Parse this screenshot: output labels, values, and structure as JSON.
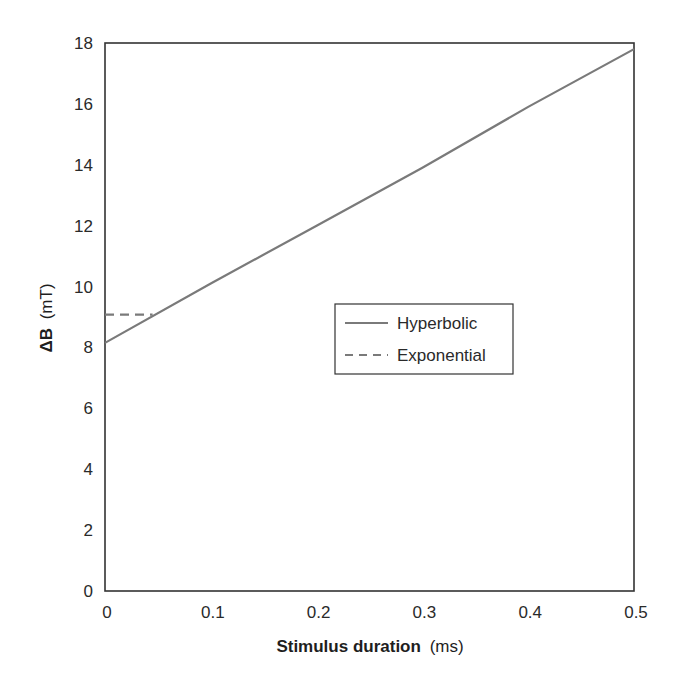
{
  "chart_data": {
    "type": "line",
    "title": "",
    "xlabel": "Stimulus duration (ms)",
    "xlabel_bold": "Stimulus duration",
    "xlabel_unit": "(ms)",
    "ylabel": "ΔB (mT)",
    "ylabel_bold": "ΔB",
    "ylabel_unit": "(mT)",
    "xlim": [
      0,
      0.5
    ],
    "ylim": [
      0,
      18
    ],
    "x_ticks": [
      "0",
      "0.1",
      "0.2",
      "0.3",
      "0.4",
      "0.5"
    ],
    "x_tick_values": [
      0,
      0.1,
      0.2,
      0.3,
      0.4,
      0.5
    ],
    "y_ticks": [
      "0",
      "2",
      "4",
      "6",
      "8",
      "10",
      "12",
      "14",
      "16",
      "18"
    ],
    "y_tick_values": [
      0,
      2,
      4,
      6,
      8,
      10,
      12,
      14,
      16,
      18
    ],
    "grid": false,
    "legend_position": "center-right",
    "series": [
      {
        "name": "Hyperbolic",
        "style": "solid",
        "color": "#7a7a7a",
        "x": [
          0,
          0.1,
          0.2,
          0.3,
          0.4,
          0.5
        ],
        "values": [
          8.15,
          10.1,
          12.0,
          13.9,
          15.9,
          17.8
        ]
      },
      {
        "name": "Exponential",
        "style": "dashed",
        "color": "#7a7a7a",
        "x": [
          0,
          0.045
        ],
        "values": [
          9.08,
          9.08
        ]
      }
    ]
  },
  "colors": {
    "frame": "#333333",
    "line": "#7a7a7a",
    "background": "#ffffff"
  }
}
